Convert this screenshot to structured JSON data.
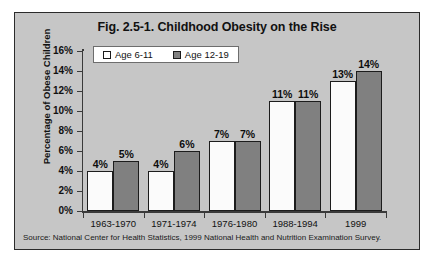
{
  "figure": {
    "title": "Fig. 2.5-1. Childhood Obesity on the Rise",
    "source_note": "Source: National Center for Health Statistics, 1999 National Health and Nutrition Examination Survey."
  },
  "colors": {
    "panel_background": "#c6c6c6",
    "plot_background": "#c6c6c6",
    "series_a_fill": "#ffffff",
    "series_b_fill": "#808080",
    "bar_outline": "#1c1c1c",
    "axis": "#3a3a3a",
    "text": "#111111"
  },
  "legend": {
    "position": "top-left-inside",
    "entries": [
      {
        "label": "Age 6-11",
        "swatch": "series-a"
      },
      {
        "label": "Age 12-19",
        "swatch": "series-b"
      }
    ]
  },
  "axes": {
    "y_title": "Percentage of Obese Children",
    "y_ticks": [
      "16%",
      "14%",
      "12%",
      "10%",
      "8%",
      "6%",
      "4%",
      "2%",
      "0%"
    ],
    "x_title": ""
  },
  "chart_data": {
    "type": "bar",
    "title": "Fig. 2.5-1. Childhood Obesity on the Rise",
    "xlabel": "",
    "ylabel": "Percentage of Obese Children",
    "ylim": [
      0,
      16
    ],
    "ytick_step": 2,
    "grid": false,
    "legend_position": "upper left inside plot",
    "categories": [
      "1963-1970",
      "1971-1974",
      "1976-1980",
      "1988-1994",
      "1999"
    ],
    "series": [
      {
        "name": "Age 6-11",
        "values": [
          4,
          4,
          7,
          11,
          13
        ],
        "labels": [
          "4%",
          "4%",
          "7%",
          "11%",
          "13%"
        ]
      },
      {
        "name": "Age 12-19",
        "values": [
          5,
          6,
          7,
          11,
          14
        ],
        "labels": [
          "5%",
          "6%",
          "7%",
          "11%",
          "14%"
        ]
      }
    ],
    "units": "percent",
    "annotation": "Source: National Center for Health Statistics, 1999 National Health and Nutrition Examination Survey."
  }
}
